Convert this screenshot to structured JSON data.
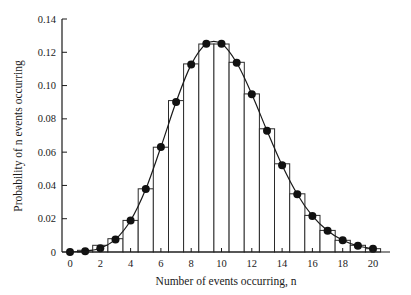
{
  "chart_data": {
    "type": "bar",
    "title": "",
    "xlabel": "Number of events occurring, n",
    "ylabel": "Probability of n events occurring",
    "xlim": [
      -0.5,
      21.2
    ],
    "ylim": [
      0,
      0.14
    ],
    "x_ticks": [
      "0",
      "2",
      "4",
      "6",
      "8",
      "10",
      "12",
      "14",
      "16",
      "18",
      "20"
    ],
    "y_ticks": [
      "0",
      "0.02",
      "0.04",
      "0.06",
      "0.08",
      "0.10",
      "0.12",
      "0.14"
    ],
    "grid": false,
    "legend": null,
    "series": [
      {
        "name": "Observed frequency (histogram)",
        "kind": "bar",
        "x": [
          0,
          1,
          2,
          3,
          4,
          5,
          6,
          7,
          8,
          9,
          10,
          11,
          12,
          13,
          14,
          15,
          16,
          17,
          18,
          19,
          20
        ],
        "values": [
          0.0,
          0.001,
          0.004,
          0.008,
          0.019,
          0.038,
          0.063,
          0.091,
          0.113,
          0.125,
          0.125,
          0.114,
          0.095,
          0.074,
          0.053,
          0.035,
          0.022,
          0.013,
          0.007,
          0.004,
          0.002
        ]
      },
      {
        "name": "Poisson distribution (mean 10)",
        "kind": "line+markers",
        "x": [
          0,
          1,
          2,
          3,
          4,
          5,
          6,
          7,
          8,
          9,
          10,
          11,
          12,
          13,
          14,
          15,
          16,
          17,
          18,
          19,
          20
        ],
        "values": [
          0.0,
          0.0005,
          0.0023,
          0.0076,
          0.0189,
          0.0378,
          0.0631,
          0.0901,
          0.1126,
          0.1251,
          0.1251,
          0.1137,
          0.0948,
          0.0729,
          0.0521,
          0.0347,
          0.0217,
          0.0128,
          0.0071,
          0.0037,
          0.0019
        ]
      }
    ]
  }
}
